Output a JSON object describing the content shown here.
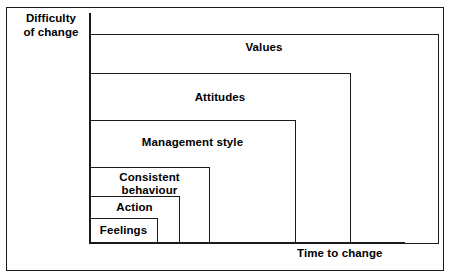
{
  "figure": {
    "axes": {
      "y_label": "Difficulty\nof change",
      "x_label": "Time to change"
    },
    "ink_color": "#1a1a1a",
    "background_color": "#ffffff"
  },
  "chart_data": {
    "type": "diagram",
    "subtype": "nested-rectangles-staircase",
    "title": "",
    "xlabel": "Time to change",
    "ylabel": "Difficulty of change",
    "categories": [
      "Feelings",
      "Action",
      "Consistent behaviour",
      "Management style",
      "Attitudes",
      "Values"
    ],
    "levels": [
      {
        "rank": 1,
        "label": "Feelings",
        "label_display": "Feelings",
        "time_to_change": 1,
        "difficulty_of_change": 1,
        "left": 89,
        "top": 218,
        "width": 69,
        "height": 26,
        "label_left": 92,
        "label_top": 224,
        "label_width": 63
      },
      {
        "rank": 2,
        "label": "Action",
        "label_display": "Action",
        "time_to_change": 2,
        "difficulty_of_change": 2,
        "left": 89,
        "top": 196,
        "width": 91,
        "height": 48,
        "label_left": 92,
        "label_top": 201,
        "label_width": 85
      },
      {
        "rank": 3,
        "label": "Consistent behaviour",
        "label_display": "Consistent\nbehaviour",
        "time_to_change": 3,
        "difficulty_of_change": 3,
        "left": 89,
        "top": 167,
        "width": 121,
        "height": 77,
        "label_left": 92,
        "label_top": 171,
        "label_width": 115
      },
      {
        "rank": 4,
        "label": "Management style",
        "label_display": "Management style",
        "time_to_change": 4,
        "difficulty_of_change": 4,
        "left": 89,
        "top": 120,
        "width": 207,
        "height": 124,
        "label_left": 92,
        "label_top": 136,
        "label_width": 201
      },
      {
        "rank": 5,
        "label": "Attitudes",
        "label_display": "Attitudes",
        "time_to_change": 5,
        "difficulty_of_change": 5,
        "left": 89,
        "top": 73,
        "width": 262,
        "height": 171,
        "label_left": 92,
        "label_top": 91,
        "label_width": 256
      },
      {
        "rank": 6,
        "label": "Values",
        "label_display": "Values",
        "time_to_change": 6,
        "difficulty_of_change": 6,
        "left": 89,
        "top": 34,
        "width": 350,
        "height": 210,
        "label_left": 92,
        "label_top": 41,
        "label_width": 344
      }
    ],
    "axis_ranges": {
      "x": "low to high (time to change)",
      "y": "low to high (difficulty of change)"
    },
    "grid": false,
    "legend": false
  }
}
